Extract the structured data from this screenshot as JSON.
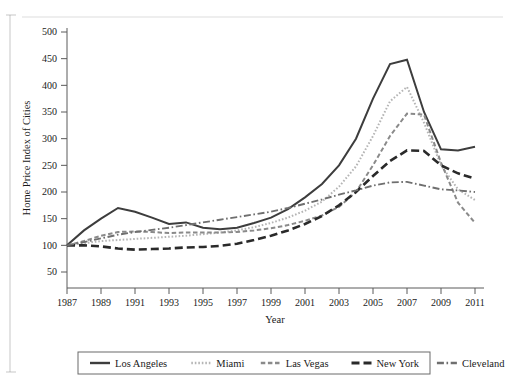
{
  "figure": {
    "top_caption": "",
    "background_color": "#ffffff"
  },
  "axes": {
    "y_title": "Home Price Index of Cities",
    "x_title": "Year",
    "y_ticks": [
      "50",
      "100",
      "150",
      "200",
      "250",
      "300",
      "350",
      "400",
      "450",
      "500"
    ],
    "x_ticks": [
      "1987",
      "1989",
      "1991",
      "1993",
      "1995",
      "1997",
      "1999",
      "2001",
      "2003",
      "2005",
      "2007",
      "2009",
      "2011"
    ]
  },
  "legend": {
    "items": [
      {
        "label": "Los Angeles",
        "style": "solid",
        "color": "#3d3d3d"
      },
      {
        "label": "Miami",
        "style": "dotted",
        "color": "#b5b5b5"
      },
      {
        "label": "Las Vegas",
        "style": "dashed",
        "color": "#8a8a8a"
      },
      {
        "label": "New York",
        "style": "long-dash",
        "color": "#2a2a2a"
      },
      {
        "label": "Cleveland",
        "style": "dash-dot",
        "color": "#6f6f6f"
      }
    ]
  },
  "chart_data": {
    "type": "line",
    "title": "",
    "xlabel": "Year",
    "ylabel": "Home Price Index of Cities",
    "xlim": [
      1987,
      2011
    ],
    "ylim": [
      50,
      500
    ],
    "ytick_step": 50,
    "xtick_step": 2,
    "grid": false,
    "legend_position": "bottom",
    "x": [
      1987,
      1988,
      1989,
      1990,
      1991,
      1992,
      1993,
      1994,
      1995,
      1996,
      1997,
      1998,
      1999,
      2000,
      2001,
      2002,
      2003,
      2004,
      2005,
      2006,
      2007,
      2008,
      2009,
      2010,
      2011
    ],
    "series": [
      {
        "name": "Los Angeles",
        "style": "solid",
        "color": "#3d3d3d",
        "values": [
          100,
          128,
          150,
          170,
          163,
          152,
          140,
          143,
          133,
          130,
          133,
          142,
          152,
          168,
          190,
          215,
          250,
          300,
          375,
          440,
          448,
          350,
          280,
          278,
          285
        ]
      },
      {
        "name": "Miami",
        "style": "dotted",
        "color": "#b5b5b5",
        "values": [
          100,
          104,
          108,
          110,
          112,
          114,
          116,
          118,
          121,
          124,
          128,
          134,
          142,
          152,
          165,
          182,
          210,
          248,
          305,
          370,
          397,
          330,
          250,
          205,
          185
        ]
      },
      {
        "name": "Las Vegas",
        "style": "dashed",
        "color": "#8a8a8a",
        "values": [
          100,
          108,
          118,
          125,
          126,
          125,
          123,
          124,
          124,
          124,
          125,
          128,
          132,
          138,
          146,
          156,
          172,
          200,
          250,
          305,
          347,
          345,
          255,
          180,
          142
        ]
      },
      {
        "name": "New York",
        "style": "long-dash",
        "color": "#2a2a2a",
        "values": [
          100,
          100,
          98,
          94,
          92,
          93,
          94,
          96,
          97,
          99,
          103,
          110,
          118,
          128,
          140,
          155,
          175,
          200,
          230,
          258,
          278,
          277,
          250,
          235,
          225
        ]
      },
      {
        "name": "Cleveland",
        "style": "dash-dot",
        "color": "#6f6f6f",
        "values": [
          100,
          106,
          113,
          120,
          125,
          129,
          133,
          138,
          143,
          148,
          153,
          158,
          163,
          170,
          178,
          186,
          195,
          203,
          212,
          218,
          219,
          212,
          205,
          203,
          200
        ]
      }
    ]
  }
}
